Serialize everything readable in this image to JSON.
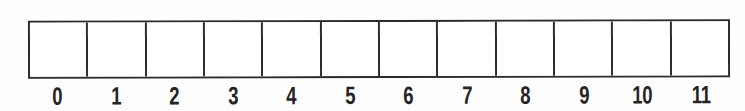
{
  "figure": {
    "background_color": "#fefefe",
    "line_color": "#2b2b2b",
    "label_color": "#242424"
  },
  "array": {
    "cell_count": 12,
    "cells": [
      {
        "index": 0,
        "value": ""
      },
      {
        "index": 1,
        "value": ""
      },
      {
        "index": 2,
        "value": ""
      },
      {
        "index": 3,
        "value": ""
      },
      {
        "index": 4,
        "value": ""
      },
      {
        "index": 5,
        "value": ""
      },
      {
        "index": 6,
        "value": ""
      },
      {
        "index": 7,
        "value": ""
      },
      {
        "index": 8,
        "value": ""
      },
      {
        "index": 9,
        "value": ""
      },
      {
        "index": 10,
        "value": ""
      },
      {
        "index": 11,
        "value": ""
      }
    ],
    "index_labels": [
      "0",
      "1",
      "2",
      "3",
      "4",
      "5",
      "6",
      "7",
      "8",
      "9",
      "10",
      "11"
    ]
  }
}
